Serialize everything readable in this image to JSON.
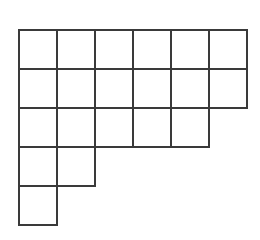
{
  "figure": {
    "kind": "grid-polyomino-figure",
    "background_color": "#ffffff",
    "line_color": "#3a3a3a",
    "line_width": 2.6,
    "total_cells": 20,
    "geometry": {
      "origin_x": 19,
      "origin_y": 30,
      "cell_width": 38,
      "cell_height": 39,
      "canvas_width": 260,
      "canvas_height": 240
    },
    "rows": [
      {
        "index": 1,
        "cells_in_row": 6
      },
      {
        "index": 2,
        "cells_in_row": 6
      },
      {
        "index": 3,
        "cells_in_row": 5
      },
      {
        "index": 4,
        "cells_in_row": 2
      },
      {
        "index": 5,
        "cells_in_row": 1
      }
    ],
    "row_widths": [
      6,
      6,
      5,
      2,
      1
    ],
    "cells": [
      {
        "row": 0,
        "col": 0
      },
      {
        "row": 0,
        "col": 1
      },
      {
        "row": 0,
        "col": 2
      },
      {
        "row": 0,
        "col": 3
      },
      {
        "row": 0,
        "col": 4
      },
      {
        "row": 0,
        "col": 5
      },
      {
        "row": 1,
        "col": 0
      },
      {
        "row": 1,
        "col": 1
      },
      {
        "row": 1,
        "col": 2
      },
      {
        "row": 1,
        "col": 3
      },
      {
        "row": 1,
        "col": 4
      },
      {
        "row": 1,
        "col": 5
      },
      {
        "row": 2,
        "col": 0
      },
      {
        "row": 2,
        "col": 1
      },
      {
        "row": 2,
        "col": 2
      },
      {
        "row": 2,
        "col": 3
      },
      {
        "row": 2,
        "col": 4
      },
      {
        "row": 3,
        "col": 0
      },
      {
        "row": 3,
        "col": 1
      },
      {
        "row": 4,
        "col": 0
      }
    ]
  }
}
